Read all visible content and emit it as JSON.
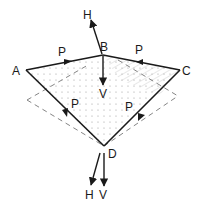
{
  "diagram": {
    "points": {
      "A": {
        "label": "A",
        "x": 26,
        "y": 70
      },
      "B": {
        "label": "B",
        "x": 103,
        "y": 55
      },
      "C": {
        "label": "C",
        "x": 180,
        "y": 70
      },
      "D": {
        "label": "D",
        "x": 104,
        "y": 146
      }
    },
    "edge_labels": {
      "AB": "P",
      "CB": "P",
      "AD": "P",
      "CD": "P"
    },
    "force_labels": {
      "top_H": "H",
      "top_V": "V",
      "bottom_H": "H",
      "bottom_V": "V"
    },
    "colors": {
      "line": "#1a1a1a",
      "dashed": "#777777",
      "shading": "#bdbdbd"
    }
  }
}
